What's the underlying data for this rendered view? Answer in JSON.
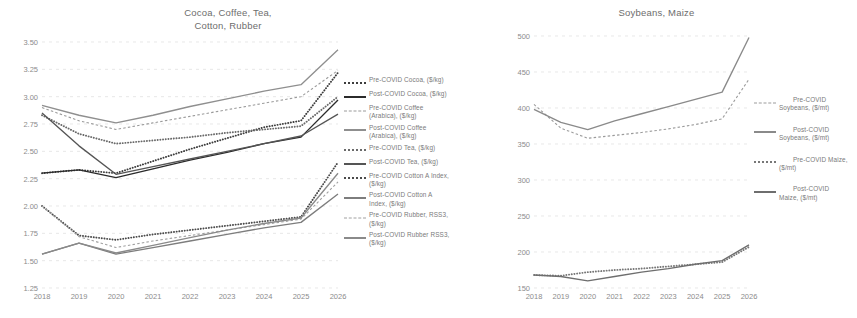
{
  "charts": [
    {
      "key": "left",
      "title": "Cocoa, Coffee, Tea,\nCotton, Rubber",
      "legend": [
        {
          "label": "Pre-COVID Cocoa, ($/kg)",
          "style": "dotted",
          "color": "#3d3d3d"
        },
        {
          "label": "Post-COVID Cocoa, ($/kg)",
          "style": "solid",
          "color": "#2b2b2b"
        },
        {
          "label": "Pre-COVID Coffee\n(Arabica), ($/kg)",
          "style": "dash",
          "color": "#9a9a9a"
        },
        {
          "label": "Post-COVID Coffee\n(Arabica), ($/kg)",
          "style": "solid",
          "color": "#8f8f8f"
        },
        {
          "label": "Pre-COVID Tea, ($/kg)",
          "style": "dotted",
          "color": "#6a6a6a"
        },
        {
          "label": "Post-COVID Tea, ($/kg)",
          "style": "solid",
          "color": "#555555"
        },
        {
          "label": "Pre-COVID Cotton A Index,\n($/kg)",
          "style": "dotted",
          "color": "#4a4a4a"
        },
        {
          "label": "Post-COVID Cotton A\nIndex, ($/kg)",
          "style": "solid",
          "color": "#7d7d7d"
        },
        {
          "label": "Pre-COVID Rubber, RSS3,\n($/kg)",
          "style": "dash",
          "color": "#a0a0a0"
        },
        {
          "label": "Post-COVID Rubber RSS3,\n($/kg)",
          "style": "solid",
          "color": "#8a8a8a"
        }
      ]
    },
    {
      "key": "right",
      "title": "Soybeans, Maize",
      "legend": [
        {
          "label": "Pre-COVID\nSoybeans, ($/mt)",
          "style": "dash",
          "color": "#9b9b9b"
        },
        {
          "label": "Post-COVID\nSoybeans, ($/mt)",
          "style": "solid",
          "color": "#8a8a8a"
        },
        {
          "label": "Pre-COVID Maize,\n($/mt)",
          "style": "dotted",
          "color": "#777777"
        },
        {
          "label": "Post-COVID\nMaize, ($/mt)",
          "style": "solid",
          "color": "#6e6e6e"
        }
      ]
    }
  ],
  "chart_data": [
    {
      "type": "line",
      "title": "Cocoa, Coffee, Tea, Cotton, Rubber",
      "xlabel": "",
      "ylabel": "",
      "x": [
        2018,
        2019,
        2020,
        2021,
        2022,
        2023,
        2024,
        2025,
        2026
      ],
      "xticklabels": [
        "2018",
        "2019",
        "2020",
        "2021",
        "2022",
        "2023",
        "2024",
        "2025",
        "2026"
      ],
      "yticklabels": [
        "1.25",
        "1.50",
        "1.75",
        "2.00",
        "2.25",
        "2.50",
        "2.75",
        "3.00",
        "3.25",
        "3.50"
      ],
      "ylim": [
        1.25,
        3.5
      ],
      "grid": true,
      "legend_position": "right",
      "series": [
        {
          "name": "Pre-COVID Cocoa, ($/kg)",
          "style": "dotted",
          "color": "#3d3d3d",
          "values": [
            2.3,
            2.33,
            2.3,
            2.41,
            2.52,
            2.62,
            2.72,
            2.78,
            3.22
          ]
        },
        {
          "name": "Post-COVID Cocoa, ($/kg)",
          "style": "solid",
          "color": "#2b2b2b",
          "values": [
            2.3,
            2.33,
            2.26,
            2.34,
            2.42,
            2.49,
            2.57,
            2.63,
            2.97
          ]
        },
        {
          "name": "Pre-COVID Coffee (Arabica), ($/kg)",
          "style": "dash",
          "color": "#9a9a9a",
          "values": [
            2.9,
            2.78,
            2.7,
            2.76,
            2.82,
            2.88,
            2.94,
            3.0,
            3.24
          ]
        },
        {
          "name": "Post-COVID Coffee (Arabica), ($/kg)",
          "style": "solid",
          "color": "#8f8f8f",
          "values": [
            2.92,
            2.83,
            2.76,
            2.83,
            2.91,
            2.98,
            3.05,
            3.11,
            3.43
          ]
        },
        {
          "name": "Pre-COVID Tea, ($/kg)",
          "style": "dotted",
          "color": "#6a6a6a",
          "values": [
            2.83,
            2.66,
            2.57,
            2.6,
            2.63,
            2.67,
            2.7,
            2.73,
            3.0
          ]
        },
        {
          "name": "Post-COVID Tea, ($/kg)",
          "style": "solid",
          "color": "#555555",
          "values": [
            2.85,
            2.55,
            2.29,
            2.36,
            2.43,
            2.5,
            2.57,
            2.64,
            2.84
          ]
        },
        {
          "name": "Pre-COVID Cotton A Index, ($/kg)",
          "style": "dotted",
          "color": "#4a4a4a",
          "values": [
            2.0,
            1.73,
            1.69,
            1.74,
            1.78,
            1.82,
            1.86,
            1.9,
            2.4
          ]
        },
        {
          "name": "Post-COVID Cotton A Index, ($/kg)",
          "style": "solid",
          "color": "#7d7d7d",
          "values": [
            1.56,
            1.66,
            1.56,
            1.62,
            1.68,
            1.74,
            1.8,
            1.85,
            2.11
          ]
        },
        {
          "name": "Pre-COVID Rubber, RSS3, ($/kg)",
          "style": "dash",
          "color": "#a0a0a0",
          "values": [
            2.0,
            1.72,
            1.62,
            1.68,
            1.73,
            1.78,
            1.83,
            1.88,
            2.22
          ]
        },
        {
          "name": "Post-COVID Rubber RSS3, ($/kg)",
          "style": "solid",
          "color": "#8a8a8a",
          "values": [
            1.56,
            1.66,
            1.57,
            1.64,
            1.71,
            1.78,
            1.84,
            1.89,
            2.3
          ]
        }
      ]
    },
    {
      "type": "line",
      "title": "Soybeans, Maize",
      "xlabel": "",
      "ylabel": "",
      "x": [
        2018,
        2019,
        2020,
        2021,
        2022,
        2023,
        2024,
        2025,
        2026
      ],
      "xticklabels": [
        "2018",
        "2019",
        "2020",
        "2021",
        "2022",
        "2023",
        "2024",
        "2025",
        "2026"
      ],
      "yticklabels": [
        "150",
        "200",
        "250",
        "300",
        "350",
        "400",
        "450",
        "500"
      ],
      "ylim": [
        150,
        500
      ],
      "grid": true,
      "legend_position": "right",
      "series": [
        {
          "name": "Pre-COVID Soybeans, ($/mt)",
          "style": "dash",
          "color": "#9b9b9b",
          "values": [
            405,
            372,
            358,
            362,
            366,
            371,
            377,
            385,
            440
          ]
        },
        {
          "name": "Post-COVID Soybeans, ($/mt)",
          "style": "solid",
          "color": "#8a8a8a",
          "values": [
            398,
            380,
            370,
            382,
            392,
            402,
            412,
            422,
            498
          ]
        },
        {
          "name": "Pre-COVID Maize, ($/mt)",
          "style": "dotted",
          "color": "#777777",
          "values": [
            168,
            167,
            172,
            175,
            177,
            180,
            183,
            186,
            207
          ]
        },
        {
          "name": "Post-COVID Maize, ($/mt)",
          "style": "solid",
          "color": "#6e6e6e",
          "values": [
            168,
            166,
            160,
            166,
            172,
            177,
            183,
            188,
            210
          ]
        }
      ]
    }
  ]
}
